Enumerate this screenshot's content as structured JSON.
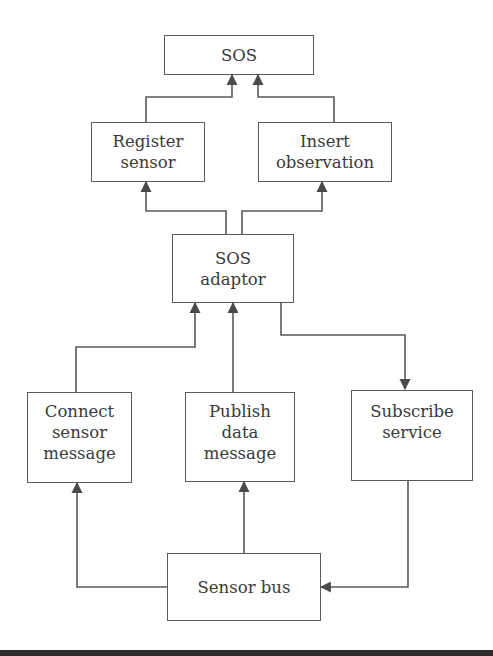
{
  "diagram": {
    "type": "flowchart",
    "line_color": "#5a5a5a",
    "nodes": {
      "sos": {
        "label": "SOS"
      },
      "register_sensor": {
        "label": "Register\nsensor"
      },
      "insert_observation": {
        "label": "Insert\nobservation"
      },
      "sos_adaptor": {
        "label": "SOS\nadaptor"
      },
      "connect_sensor_message": {
        "label": "Connect\nsensor\nmessage"
      },
      "publish_data_message": {
        "label": "Publish\ndata\nmessage"
      },
      "subscribe_service": {
        "label": "Subscribe\nservice"
      },
      "sensor_bus": {
        "label": "Sensor bus"
      }
    },
    "edges": [
      {
        "from": "Register sensor",
        "to": "SOS"
      },
      {
        "from": "Insert observation",
        "to": "SOS"
      },
      {
        "from": "SOS adaptor",
        "to": "Register sensor"
      },
      {
        "from": "SOS adaptor",
        "to": "Insert observation"
      },
      {
        "from": "Connect sensor message",
        "to": "SOS adaptor"
      },
      {
        "from": "Publish data message",
        "to": "SOS adaptor"
      },
      {
        "from": "SOS adaptor",
        "to": "Subscribe service"
      },
      {
        "from": "Sensor bus",
        "to": "Connect sensor message"
      },
      {
        "from": "Sensor bus",
        "to": "Publish data message"
      },
      {
        "from": "Subscribe service",
        "to": "Sensor bus"
      }
    ]
  }
}
